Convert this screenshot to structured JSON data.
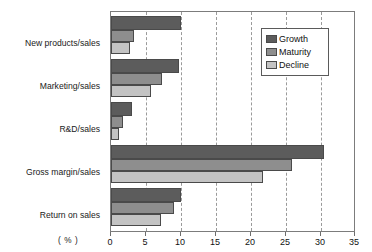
{
  "chart_data": {
    "type": "bar",
    "orientation": "horizontal",
    "title": "",
    "xlabel": "( % )",
    "ylabel": "",
    "xlim": [
      0,
      35
    ],
    "xticks": [
      0,
      5,
      10,
      15,
      20,
      25,
      30,
      35
    ],
    "grid": true,
    "grid_style": "dashed-vertical",
    "legend_position": "upper right",
    "categories": [
      "New products/sales",
      "Marketing/sales",
      "R&D/sales",
      "Gross margin/sales",
      "Return on sales"
    ],
    "series": [
      {
        "name": "Growth",
        "color": "#5c5c5c",
        "values": [
          10.0,
          9.8,
          3.0,
          30.5,
          10.0
        ]
      },
      {
        "name": "Maturity",
        "color": "#8e8e8e",
        "values": [
          3.3,
          7.3,
          1.7,
          26.0,
          9.1
        ]
      },
      {
        "name": "Decline",
        "color": "#c3c3c3",
        "values": [
          2.7,
          5.8,
          1.2,
          21.8,
          7.2
        ]
      }
    ]
  },
  "axis": {
    "unit_label": "( % )",
    "tick_labels": [
      "0",
      "5",
      "10",
      "15",
      "20",
      "25",
      "30",
      "35"
    ]
  },
  "legend": {
    "entries": [
      {
        "label": "Growth"
      },
      {
        "label": "Maturity"
      },
      {
        "label": "Decline"
      }
    ]
  },
  "top_caption": ""
}
